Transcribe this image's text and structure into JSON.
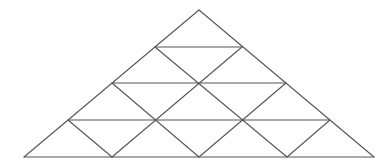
{
  "diagram": {
    "stroke_color": "#555555",
    "background": "#ffffff",
    "vertices": {
      "apex": [
        199,
        10
      ],
      "row1": [
        [
          155,
          47
        ],
        [
          242,
          47
        ]
      ],
      "row2": [
        [
          112,
          83
        ],
        [
          199,
          83
        ],
        [
          286,
          83
        ]
      ],
      "row3": [
        [
          68,
          120
        ],
        [
          155,
          120
        ],
        [
          243,
          120
        ],
        [
          330,
          120
        ]
      ],
      "base": [
        [
          24,
          157
        ],
        [
          112,
          157
        ],
        [
          199,
          157
        ],
        [
          287,
          157
        ],
        [
          374,
          157
        ]
      ]
    },
    "lines": [
      {
        "id": "left-edge",
        "x1": 199,
        "y1": 10,
        "x2": 24,
        "y2": 157
      },
      {
        "id": "right-edge",
        "x1": 199,
        "y1": 10,
        "x2": 374,
        "y2": 157
      },
      {
        "id": "base",
        "x1": 24,
        "y1": 157,
        "x2": 374,
        "y2": 157
      },
      {
        "id": "horizontal-1",
        "x1": 155,
        "y1": 47,
        "x2": 242,
        "y2": 47
      },
      {
        "id": "horizontal-2",
        "x1": 112,
        "y1": 83,
        "x2": 286,
        "y2": 83
      },
      {
        "id": "horizontal-3",
        "x1": 68,
        "y1": 120,
        "x2": 330,
        "y2": 120
      },
      {
        "id": "diag-down-right-1",
        "x1": 155,
        "y1": 47,
        "x2": 287,
        "y2": 157
      },
      {
        "id": "diag-down-right-2",
        "x1": 112,
        "y1": 83,
        "x2": 199,
        "y2": 157
      },
      {
        "id": "diag-down-right-3",
        "x1": 68,
        "y1": 120,
        "x2": 112,
        "y2": 157
      },
      {
        "id": "diag-down-left-1",
        "x1": 242,
        "y1": 47,
        "x2": 112,
        "y2": 157
      },
      {
        "id": "diag-down-left-2",
        "x1": 286,
        "y1": 83,
        "x2": 199,
        "y2": 157
      },
      {
        "id": "diag-down-left-3",
        "x1": 330,
        "y1": 120,
        "x2": 287,
        "y2": 157
      }
    ]
  }
}
